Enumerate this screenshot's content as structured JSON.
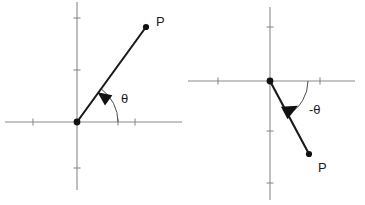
{
  "figure": {
    "background_color": "#ffffff",
    "axis_color": "#8a8a8a",
    "ray_color": "#1a1a1a",
    "arc_color": "#4a4a4a",
    "label_color": "#1a1a1a",
    "width": 365,
    "height": 205
  },
  "diagrams": [
    {
      "id": "positive-angle",
      "name": "positive-angle-diagram",
      "origin": {
        "x": 77,
        "y": 122
      },
      "x_axis": {
        "x1": 5,
        "y1": 122,
        "x2": 182,
        "y2": 122
      },
      "y_axis": {
        "x1": 77,
        "y1": 2,
        "x2": 77,
        "y2": 190
      },
      "x_ticks": [
        {
          "x": 33,
          "length": 7
        },
        {
          "x": 118,
          "length": 7
        },
        {
          "x": 135,
          "length": 7
        }
      ],
      "y_ticks": [
        {
          "y": 18,
          "length": 7
        },
        {
          "y": 70,
          "length": 7
        },
        {
          "y": 168,
          "length": 7
        }
      ],
      "ray": {
        "x1": 77,
        "y1": 122,
        "x2": 146,
        "y2": 27
      },
      "point": {
        "x": 146,
        "y": 27,
        "radius": 3.1
      },
      "point_label": {
        "text": "P",
        "x": 156,
        "y": 26
      },
      "arrow": {
        "x": 104,
        "y": 97,
        "angle_deg": -54,
        "size": 8
      },
      "arc": {
        "radius": 41,
        "start_angle_deg": 0,
        "end_angle_deg": 54,
        "direction": "counterclockwise"
      },
      "angle_label": {
        "text": "θ",
        "x": 121,
        "y": 103
      }
    },
    {
      "id": "negative-angle",
      "name": "negative-angle-diagram",
      "origin": {
        "x": 270,
        "y": 81
      },
      "x_axis": {
        "x1": 188,
        "y1": 81,
        "x2": 355,
        "y2": 81
      },
      "y_axis": {
        "x1": 270,
        "y1": 7,
        "x2": 270,
        "y2": 200
      },
      "x_ticks": [
        {
          "x": 218,
          "length": 7
        },
        {
          "x": 320,
          "length": 7
        }
      ],
      "y_ticks": [
        {
          "y": 27,
          "length": 7
        },
        {
          "y": 131,
          "length": 7
        },
        {
          "y": 183,
          "length": 7
        }
      ],
      "ray": {
        "x1": 270,
        "y1": 81,
        "x2": 309,
        "y2": 154
      },
      "point": {
        "x": 309,
        "y": 154,
        "radius": 3.1
      },
      "point_label": {
        "text": "P",
        "x": 318,
        "y": 172
      },
      "arrow": {
        "x": 290,
        "y": 110,
        "angle_deg": 62,
        "size": 9
      },
      "arc": {
        "radius": 38,
        "start_angle_deg": 0,
        "end_angle_deg": -62,
        "direction": "clockwise"
      },
      "angle_label": {
        "text": "-θ",
        "x": 309,
        "y": 114
      }
    }
  ]
}
